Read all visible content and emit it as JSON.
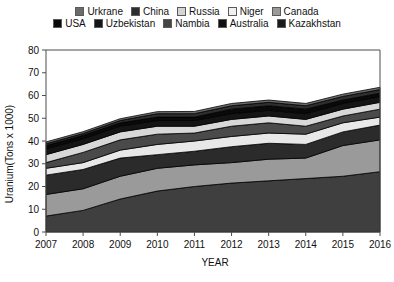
{
  "legend": {
    "rows": [
      [
        {
          "label": "Urkrane",
          "color": "#6b6b6b"
        },
        {
          "label": "China",
          "color": "#2e2e2e"
        },
        {
          "label": "Russia",
          "color": "#d4d4d4"
        },
        {
          "label": "Niger",
          "color": "#f0f0f0"
        },
        {
          "label": "Canada",
          "color": "#9a9a9a"
        }
      ],
      [
        {
          "label": "USA",
          "color": "#0a0a0a"
        },
        {
          "label": "Uzbekistan",
          "color": "#151515"
        },
        {
          "label": "Nambia",
          "color": "#454545"
        },
        {
          "label": "Australia",
          "color": "#101010"
        },
        {
          "label": "Kazakhstan",
          "color": "#1a1a1a"
        }
      ]
    ]
  },
  "axes": {
    "y_title": "Uranium(Tons x 1000)",
    "x_title": "YEAR",
    "y_ticks": [
      "0",
      "10",
      "20",
      "30",
      "40",
      "50",
      "60",
      "70",
      "80"
    ],
    "x_ticks": [
      "2007",
      "2008",
      "2009",
      "2010",
      "2011",
      "2012",
      "2013",
      "2014",
      "2015",
      "2016"
    ]
  },
  "chart_data": {
    "type": "area",
    "title": "",
    "xlabel": "YEAR",
    "ylabel": "Uranium(Tons x 1000)",
    "xlim": [
      2007,
      2016
    ],
    "ylim": [
      0,
      80
    ],
    "ytick_step": 10,
    "grid": false,
    "legend_position": "top",
    "stacked": true,
    "stack_order_bottom_to_top": [
      "Kazakhstan",
      "Canada",
      "Australia",
      "Niger",
      "Nambia",
      "Russia",
      "Uzbekistan",
      "USA",
      "China",
      "Urkrane"
    ],
    "categories": [
      2007,
      2008,
      2009,
      2010,
      2011,
      2012,
      2013,
      2014,
      2015,
      2016
    ],
    "series": [
      {
        "name": "Kazakhstan",
        "color": "#3f3f3f",
        "values": [
          7.0,
          9.5,
          14.5,
          18.0,
          20.0,
          21.5,
          22.5,
          23.5,
          24.5,
          26.5
        ]
      },
      {
        "name": "Canada",
        "color": "#9a9a9a",
        "values": [
          9.5,
          9.5,
          10.0,
          10.0,
          9.5,
          9.0,
          9.5,
          9.0,
          13.5,
          14.0
        ]
      },
      {
        "name": "Australia",
        "color": "#2b2b2b",
        "values": [
          8.5,
          8.5,
          8.0,
          6.0,
          6.0,
          7.0,
          7.0,
          6.0,
          6.0,
          6.5
        ]
      },
      {
        "name": "Niger",
        "color": "#e8e8e8",
        "values": [
          3.0,
          3.0,
          3.5,
          4.5,
          4.5,
          4.5,
          4.5,
          4.5,
          4.0,
          3.5
        ]
      },
      {
        "name": "Nambia",
        "color": "#4a4a4a",
        "values": [
          2.5,
          4.5,
          4.5,
          4.5,
          3.5,
          4.5,
          4.5,
          3.5,
          3.0,
          3.5
        ]
      },
      {
        "name": "Russia",
        "color": "#d8d8d8",
        "values": [
          3.5,
          3.5,
          3.5,
          3.5,
          3.0,
          3.0,
          3.0,
          3.0,
          3.0,
          3.0
        ]
      },
      {
        "name": "Uzbekistan",
        "color": "#151515",
        "values": [
          2.5,
          2.5,
          2.5,
          2.5,
          2.5,
          2.5,
          2.5,
          2.5,
          2.5,
          2.5
        ]
      },
      {
        "name": "USA",
        "color": "#0a0a0a",
        "values": [
          1.5,
          1.5,
          1.5,
          1.5,
          1.5,
          2.0,
          2.0,
          2.0,
          1.5,
          1.5
        ]
      },
      {
        "name": "China",
        "color": "#2e2e2e",
        "values": [
          0.8,
          0.8,
          1.0,
          1.5,
          1.5,
          1.5,
          1.5,
          1.5,
          1.6,
          1.6
        ]
      },
      {
        "name": "Urkrane",
        "color": "#6b6b6b",
        "values": [
          0.8,
          0.8,
          0.8,
          0.9,
          1.0,
          1.0,
          1.0,
          1.0,
          1.0,
          1.0
        ]
      }
    ]
  }
}
